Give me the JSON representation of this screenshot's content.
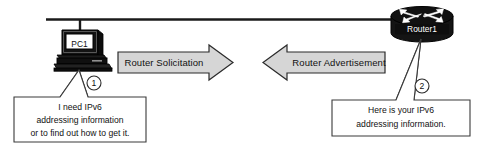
{
  "diagram": {
    "colors": {
      "line": "#1a1a1a",
      "device_fill": "#111111",
      "arrow_fill": "#d6d6d6",
      "arrow_stroke": "#2b2b2b",
      "callout_fill": "#ffffff",
      "callout_stroke": "#3a3a3a",
      "text": "#111111",
      "device_label_text": "#ffffff"
    },
    "devices": [
      {
        "id": "pc1",
        "icon": "desktop-computer-icon",
        "label": "PC1"
      },
      {
        "id": "router1",
        "icon": "router-icon",
        "label": "Router1"
      }
    ],
    "messages": [
      {
        "id": "router-solicitation",
        "label": "Router Solicitation",
        "direction": "right"
      },
      {
        "id": "router-advertisement",
        "label": "Router Advertisement",
        "direction": "left"
      }
    ],
    "step_markers": [
      {
        "id": "step-1",
        "label": "1"
      },
      {
        "id": "step-2",
        "label": "2"
      }
    ],
    "callouts": [
      {
        "id": "pc1-callout",
        "lines": [
          "I need IPv6",
          "addressing information",
          "or to find out how to get it."
        ]
      },
      {
        "id": "router1-callout",
        "lines": [
          "Here is your IPv6",
          "addressing information."
        ]
      }
    ]
  }
}
